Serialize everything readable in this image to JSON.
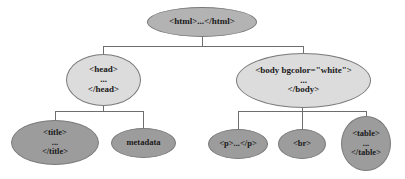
{
  "diagram": {
    "type": "tree",
    "colors": {
      "root_fill": "#b3b3b3",
      "level1_fill": "#dcdcdc",
      "level2_fill": "#9c9c9c",
      "edge": "#6e6e6e"
    },
    "root": {
      "id": "html",
      "lines": [
        "<html>...</html>"
      ]
    },
    "level1": [
      {
        "id": "head",
        "parent": "html",
        "lines": [
          "<head>",
          "...",
          "</head>"
        ]
      },
      {
        "id": "body",
        "parent": "html",
        "lines": [
          "<body bgcolor=\"white\">",
          "...",
          "</body>"
        ]
      }
    ],
    "level2": [
      {
        "id": "title",
        "parent": "head",
        "lines": [
          "<title>",
          "...",
          "</title>"
        ]
      },
      {
        "id": "metadata",
        "parent": "head",
        "lines": [
          "metadata"
        ]
      },
      {
        "id": "p",
        "parent": "body",
        "lines": [
          "<p>...</p>"
        ]
      },
      {
        "id": "br",
        "parent": "body",
        "lines": [
          "<br>"
        ]
      },
      {
        "id": "table",
        "parent": "body",
        "lines": [
          "<table>",
          "...",
          "</table>"
        ]
      }
    ]
  }
}
